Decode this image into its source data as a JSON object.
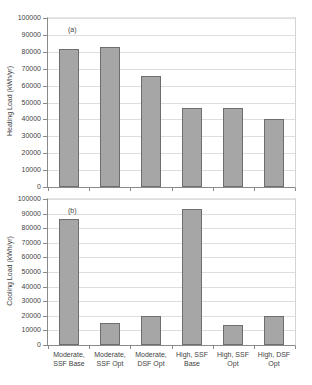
{
  "colors": {
    "background": "#ffffff",
    "bar_fill": "#a6a6a6",
    "bar_border": "#6e6e6e",
    "gridline": "#dedede",
    "axis": "#8a8a8a",
    "text": "#3f3f3f"
  },
  "chart_data": [
    {
      "type": "bar",
      "panel_label": "(a)",
      "title": "",
      "xlabel": "",
      "ylabel": "Heating Load (kWh/yr)",
      "categories": [
        "Moderate,\nSSF Base",
        "Moderate,\nSSF Opt",
        "Moderate,\nDSF Opt",
        "High, SSF\nBase",
        "High, SSF\nOpt",
        "High, DSF\nOpt"
      ],
      "values": [
        81500,
        83000,
        65500,
        46500,
        47000,
        40000
      ],
      "ylim": [
        0,
        100000
      ],
      "ytick_step": 10000,
      "ytick_labels": [
        "0",
        "10000",
        "20000",
        "30000",
        "40000",
        "50000",
        "60000",
        "70000",
        "80000",
        "90000",
        "100000"
      ],
      "grid": true,
      "legend_position": "none",
      "show_category_labels": false
    },
    {
      "type": "bar",
      "panel_label": "(b)",
      "title": "",
      "xlabel": "",
      "ylabel": "Cooling Load (kWh/yr)",
      "categories": [
        "Moderate,\nSSF Base",
        "Moderate,\nSSF Opt",
        "Moderate,\nDSF Opt",
        "High, SSF\nBase",
        "High, SSF\nOpt",
        "High, DSF\nOpt"
      ],
      "values": [
        86000,
        15000,
        20000,
        93000,
        14000,
        20000
      ],
      "ylim": [
        0,
        100000
      ],
      "ytick_step": 10000,
      "ytick_labels": [
        "0",
        "10000",
        "20000",
        "30000",
        "40000",
        "50000",
        "60000",
        "70000",
        "80000",
        "90000",
        "100000"
      ],
      "grid": true,
      "legend_position": "none",
      "show_category_labels": true
    }
  ]
}
